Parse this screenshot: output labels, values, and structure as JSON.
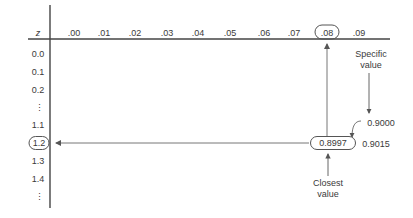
{
  "table": {
    "corner_label": "z",
    "columns": [
      ".00",
      ".01",
      ".02",
      ".03",
      ".04",
      ".05",
      ".06",
      ".07",
      ".08",
      ".09"
    ],
    "rows": [
      "0.0",
      "0.1",
      "0.2",
      "⋮",
      "1.1",
      "1.2",
      "1.3",
      "1.4",
      "⋮"
    ],
    "highlighted_column": ".08",
    "highlighted_row": "1.2"
  },
  "annotations": {
    "closest_cell_value": "0.8997",
    "specific_value_label": "Specific value",
    "specific_value_line1": "Specific",
    "specific_value_line2": "value",
    "specific_value": "0.9000",
    "next_value": "0.9015",
    "closest_value_line1": "Closest",
    "closest_value_line2": "value"
  },
  "colors": {
    "line": "#444444",
    "text": "#3a3a3a",
    "arrow": "#666666"
  }
}
